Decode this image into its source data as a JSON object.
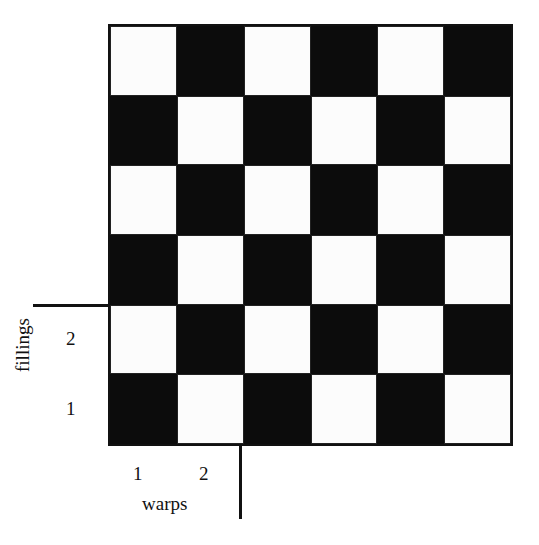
{
  "diagram": {
    "type": "plain weave checkerboard",
    "rows": 6,
    "cols": 6,
    "pattern": [
      [
        "W",
        "B",
        "W",
        "B",
        "W",
        "B"
      ],
      [
        "B",
        "W",
        "B",
        "W",
        "B",
        "W"
      ],
      [
        "W",
        "B",
        "W",
        "B",
        "W",
        "B"
      ],
      [
        "B",
        "W",
        "B",
        "W",
        "B",
        "W"
      ],
      [
        "W",
        "B",
        "W",
        "B",
        "W",
        "B"
      ],
      [
        "B",
        "W",
        "B",
        "W",
        "B",
        "W"
      ]
    ],
    "colors": {
      "black": "#0c0c0c",
      "white": "#fcfcfc"
    }
  },
  "labels": {
    "fillings": "fillings",
    "warps": "warps",
    "filling_1": "1",
    "filling_2": "2",
    "warp_1": "1",
    "warp_2": "2"
  }
}
